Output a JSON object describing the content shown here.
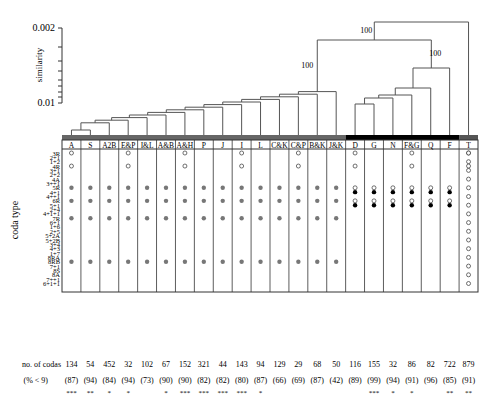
{
  "chart_data": {
    "type": "dendrogram-dotmatrix",
    "axis": {
      "ylabel": "similarity",
      "ticks": [
        "0.002",
        "0.01"
      ]
    },
    "bootstrap_labels": [
      "100",
      "100",
      "100"
    ],
    "ylabel_rows": "coda type",
    "columns": [
      "A",
      "S",
      "A2B",
      "E&P",
      "I&L",
      "A&B",
      "A&H",
      "P",
      "J",
      "I",
      "L",
      "C&K",
      "C&P",
      "B&K",
      "J&K",
      "D",
      "G",
      "N",
      "F&G",
      "Q",
      "F",
      "T"
    ],
    "rows": [
      "3R",
      "2+1",
      "1+2",
      "4R",
      "3+1",
      "2+2",
      "4A",
      "3++1",
      "5R",
      "4+1",
      "4++1",
      "6R",
      "5+1",
      "2+4",
      "4+1+1",
      "7R",
      "6+1",
      "1+6",
      "2+5",
      "5+2A",
      "5+2B",
      "3+4",
      "4+3",
      "1+7",
      "8RA",
      "8RB",
      "7+1",
      "8S",
      "8A",
      "7++1",
      "6+1+1"
    ],
    "no_of_codas": [
      134,
      54,
      452,
      32,
      102,
      67,
      152,
      321,
      44,
      143,
      94,
      129,
      29,
      68,
      50,
      116,
      155,
      32,
      86,
      82,
      722,
      879
    ],
    "pct_lt9": [
      "(87)",
      "(94)",
      "(84)",
      "(94)",
      "(73)",
      "(90)",
      "(90)",
      "(82)",
      "(82)",
      "(80)",
      "(87)",
      "(66)",
      "(69)",
      "(87)",
      "(42)",
      "(89)",
      "(99)",
      "(94)",
      "(91)",
      "(96)",
      "(85)",
      "(91)"
    ],
    "significance": [
      "***",
      "**",
      "*",
      "*",
      "",
      "*",
      "***",
      "***",
      "***",
      "***",
      "*",
      "",
      "",
      "",
      "",
      "",
      "***",
      "*",
      "*",
      "",
      "**",
      "**"
    ],
    "row_labels": {
      "no_codas": "no. of codas",
      "pct": "(% < 9)"
    }
  }
}
